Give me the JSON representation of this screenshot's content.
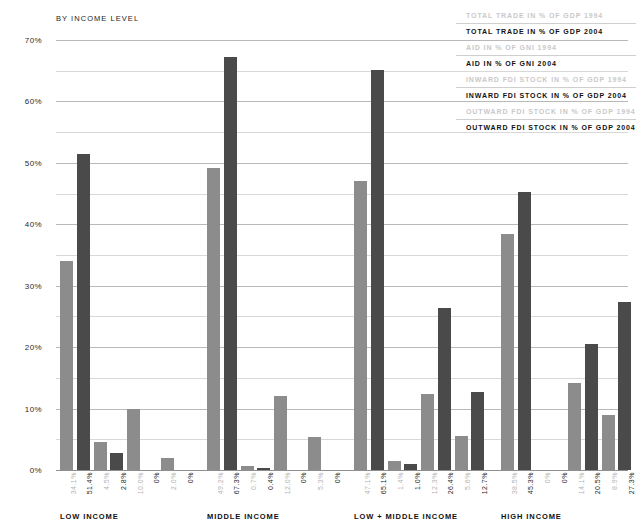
{
  "subtitle": "BY INCOME LEVEL",
  "legend": [
    {
      "old": "TOTAL TRADE IN % OF GDP 1994",
      "new": "TOTAL TRADE IN % OF GDP 2004"
    },
    {
      "old": "AID IN % OF GNI 1994",
      "new": "AID IN % OF GNI 2004"
    },
    {
      "old": "INWARD FDI STOCK IN % OF GDP 1994",
      "new": "INWARD FDI STOCK IN % OF GDP 2004"
    },
    {
      "old": "OUTWARD FDI STOCK IN % OF GDP 1994",
      "new": "OUTWARD FDI STOCK IN % OF GDP 2004"
    }
  ],
  "colors": {
    "bar_1994": "#8c8c8c",
    "bar_2004": "#4a4a4a",
    "label_1994": "#b4b4b4",
    "label_2004": "#2a2a2a",
    "gridline": "#d8d8d8",
    "background": "#ffffff"
  },
  "chart_data": {
    "type": "bar",
    "title": "BY INCOME LEVEL",
    "xlabel": "",
    "ylabel": "",
    "ylim": [
      0,
      70
    ],
    "yticks": [
      0,
      10,
      20,
      30,
      40,
      50,
      60,
      70
    ],
    "ytick_labels": [
      "0%",
      "10%",
      "20%",
      "30%",
      "40%",
      "50%",
      "60%",
      "70%"
    ],
    "gridlines_every": 5,
    "grid": true,
    "legend_position": "top-right",
    "categories": [
      "LOW INCOME",
      "MIDDLE INCOME",
      "LOW + MIDDLE INCOME",
      "HIGH INCOME"
    ],
    "series": [
      {
        "name": "TOTAL TRADE IN % OF GDP 1994",
        "year": "1994",
        "values": [
          34.1,
          49.2,
          47.1,
          38.5
        ],
        "labels": [
          "34.1%",
          "49.2%",
          "47.1%",
          "38.5%"
        ]
      },
      {
        "name": "TOTAL TRADE IN % OF GDP 2004",
        "year": "2004",
        "values": [
          51.4,
          67.3,
          65.1,
          45.3
        ],
        "labels": [
          "51.4%",
          "67.3%",
          "65.1%",
          "45.3%"
        ]
      },
      {
        "name": "AID IN % OF GNI 1994",
        "year": "1994",
        "values": [
          4.5,
          0.7,
          1.4,
          0.0
        ],
        "labels": [
          "4.5%",
          "0.7%",
          "1.4%",
          "0%"
        ]
      },
      {
        "name": "AID IN % OF GNI 2004",
        "year": "2004",
        "values": [
          2.8,
          0.4,
          1.0,
          0.0
        ],
        "labels": [
          "2.8%",
          "0.4%",
          "1.0%",
          "0%"
        ]
      },
      {
        "name": "INWARD FDI STOCK IN % OF GDP 1994",
        "year": "1994",
        "values": [
          10.0,
          12.0,
          12.3,
          14.1
        ],
        "labels": [
          "10.0%",
          "12.0%",
          "12.3%",
          "14.1%"
        ]
      },
      {
        "name": "INWARD FDI STOCK IN % OF GDP 2004",
        "year": "2004",
        "values": [
          0.0,
          0.0,
          26.4,
          20.5
        ],
        "labels": [
          "0%",
          "0%",
          "26.4%",
          "20.5%"
        ]
      },
      {
        "name": "OUTWARD FDI STOCK IN % OF GDP 1994",
        "year": "1994",
        "values": [
          2.0,
          5.3,
          5.6,
          8.9
        ],
        "labels": [
          "2.0%",
          "5.3%",
          "5.6%",
          "8.9%"
        ]
      },
      {
        "name": "OUTWARD FDI STOCK IN % OF GDP 2004",
        "year": "2004",
        "values": [
          0.0,
          0.0,
          12.7,
          27.3
        ],
        "labels": [
          "0%",
          "0%",
          "12.7%",
          "27.3%"
        ]
      }
    ]
  }
}
